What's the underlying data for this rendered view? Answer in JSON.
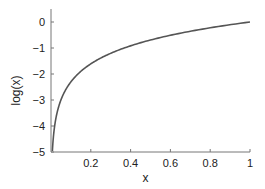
{
  "chart_data": {
    "type": "line",
    "title": "",
    "xlabel": "x",
    "ylabel": "log(x)",
    "xlim": [
      0,
      1
    ],
    "ylim": [
      -5,
      0.5
    ],
    "xticks": [
      0.2,
      0.4,
      0.6,
      0.8,
      1
    ],
    "xtick_labels": [
      "0.2",
      "0.4",
      "0.6",
      "0.8",
      "1"
    ],
    "yticks": [
      0,
      -1,
      -2,
      -3,
      -4,
      -5
    ],
    "ytick_labels": [
      "0",
      "−1",
      "−2",
      "−3",
      "−4",
      "−5"
    ],
    "grid": false,
    "legend": null,
    "series": [
      {
        "name": "log(x)",
        "color": "#555555",
        "x": [
          0.007,
          0.01,
          0.02,
          0.03,
          0.05,
          0.075,
          0.1,
          0.15,
          0.2,
          0.3,
          0.4,
          0.5,
          0.6,
          0.7,
          0.8,
          0.9,
          1.0
        ],
        "y": [
          -4.96,
          -4.61,
          -3.91,
          -3.51,
          -3.0,
          -2.59,
          -2.3,
          -1.9,
          -1.61,
          -1.2,
          -0.92,
          -0.69,
          -0.51,
          -0.36,
          -0.22,
          -0.11,
          0.0
        ]
      }
    ]
  }
}
